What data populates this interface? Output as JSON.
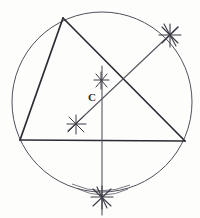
{
  "figure": {
    "background_color": "#fdfdfc",
    "ink_color": "#2b2b33",
    "circle_color": "#4a4a55",
    "construction_color": "#55555f",
    "canvas": {
      "width": 200,
      "height": 218
    }
  },
  "labels": {
    "center_point": "C"
  },
  "circle": {
    "name": "circumcircle",
    "cx": 102,
    "cy": 102,
    "r": 90,
    "stroke_width": 1.0
  },
  "triangle": {
    "name": "inscribed-triangle",
    "stroke_width": 1.6,
    "vertices": [
      {
        "name": "apex",
        "x": 63,
        "y": 18
      },
      {
        "name": "bottom-left",
        "x": 20,
        "y": 140
      },
      {
        "name": "bottom-right",
        "x": 185,
        "y": 141
      }
    ],
    "sides": [
      {
        "name": "left-side",
        "x1": 63,
        "y1": 18,
        "x2": 20,
        "y2": 140
      },
      {
        "name": "base-side",
        "x1": 20,
        "y1": 140,
        "x2": 185,
        "y2": 141
      },
      {
        "name": "right-side",
        "x1": 63,
        "y1": 18,
        "x2": 185,
        "y2": 141
      }
    ]
  },
  "construction_lines": [
    {
      "name": "perpendicular-bisector-vertical",
      "x1": 102,
      "y1": 66,
      "x2": 102,
      "y2": 215,
      "stroke_width": 1.1
    },
    {
      "name": "perpendicular-bisector-diagonal",
      "x1": 68,
      "y1": 131,
      "x2": 178,
      "y2": 27,
      "stroke_width": 1.1
    }
  ],
  "arc_marks": [
    {
      "name": "arc-intersection-upper-right",
      "x": 170,
      "y": 35,
      "size": 11,
      "strokes": 5
    },
    {
      "name": "arc-intersection-center-upper",
      "x": 101,
      "y": 80,
      "size": 8,
      "strokes": 4
    },
    {
      "name": "arc-intersection-lower-left",
      "x": 76,
      "y": 124,
      "size": 9,
      "strokes": 4
    },
    {
      "name": "arc-intersection-bottom",
      "x": 102,
      "y": 197,
      "size": 11,
      "strokes": 5
    }
  ],
  "arcs": [
    {
      "name": "arc-sweep-bottom-left",
      "d": "M 76 185 Q 102 196 124 186"
    },
    {
      "name": "arc-sweep-bottom-right",
      "d": "M 80 189 Q 103 200 127 190"
    }
  ],
  "center_marker": {
    "name": "circumcenter",
    "x": 102,
    "y": 98,
    "label_x": 90,
    "label_y": 100,
    "font_size": 11
  }
}
